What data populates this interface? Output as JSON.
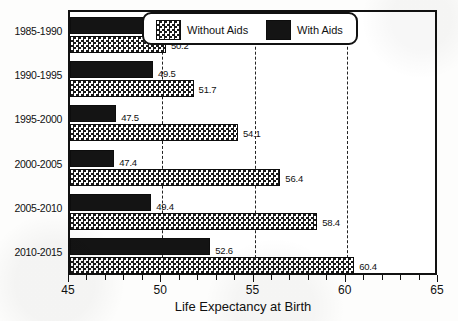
{
  "chart_data": {
    "type": "bar",
    "orientation": "horizontal",
    "title": "",
    "xlabel": "Life Expectancy at Birth",
    "ylabel": "",
    "xlim": [
      45,
      65
    ],
    "xticks": [
      45,
      50,
      55,
      60,
      65
    ],
    "xtick_labels": [
      "45",
      "50",
      "55",
      "60",
      "65"
    ],
    "minor_tick_step": 1,
    "grid": true,
    "grid_axis": "x",
    "grid_style": "dashed",
    "grid_values": [
      50,
      55,
      60
    ],
    "legend_position": "top-right-inside",
    "categories": [
      "1985-1990",
      "1990-1995",
      "1995-2000",
      "2000-2005",
      "2005-2010",
      "2010-2015"
    ],
    "series": [
      {
        "name": "With Aids",
        "pattern": "solid-black",
        "color": "#141414",
        "values": [
          49.2,
          49.5,
          47.5,
          47.4,
          49.4,
          52.6
        ],
        "labels": [
          "49.2",
          "49.5",
          "47.5",
          "47.4",
          "49.4",
          "52.6"
        ]
      },
      {
        "name": "Without Aids",
        "pattern": "checkerboard",
        "color": "#f2f2f2",
        "values": [
          50.2,
          51.7,
          54.1,
          56.4,
          58.4,
          60.4
        ],
        "labels": [
          "50.2",
          "51.7",
          "54.1",
          "56.4",
          "58.4",
          "60.4"
        ]
      }
    ]
  },
  "legend": {
    "items": [
      {
        "label": "Without Aids",
        "swatch": "checkerboard-swatch"
      },
      {
        "label": "With Aids",
        "swatch": "solid-black-swatch"
      }
    ]
  },
  "axis": {
    "x_title": "Life Expectancy at Birth",
    "tick_labels": [
      "45",
      "50",
      "55",
      "60",
      "65"
    ]
  },
  "categories": [
    "1985-1990",
    "1990-1995",
    "1995-2000",
    "2000-2005",
    "2005-2010",
    "2010-2015"
  ],
  "colors": {
    "ink": "#111111",
    "bar_with_aids": "#141414",
    "bar_without_aids": "#f2f2f2",
    "background": "#ffffff"
  }
}
